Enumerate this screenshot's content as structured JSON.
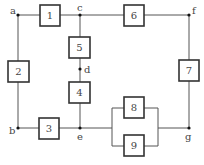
{
  "diagram": {
    "type": "reliability-block-diagram",
    "components": [
      {
        "id": "1",
        "label": "1"
      },
      {
        "id": "2",
        "label": "2"
      },
      {
        "id": "3",
        "label": "3"
      },
      {
        "id": "4",
        "label": "4"
      },
      {
        "id": "5",
        "label": "5"
      },
      {
        "id": "6",
        "label": "6"
      },
      {
        "id": "7",
        "label": "7"
      },
      {
        "id": "8",
        "label": "8"
      },
      {
        "id": "9",
        "label": "9"
      }
    ],
    "nodes": [
      {
        "id": "a",
        "label": "a"
      },
      {
        "id": "b",
        "label": "b"
      },
      {
        "id": "c",
        "label": "c"
      },
      {
        "id": "d",
        "label": "d"
      },
      {
        "id": "e",
        "label": "e"
      },
      {
        "id": "f",
        "label": "f"
      },
      {
        "id": "g",
        "label": "g"
      }
    ],
    "connections": [
      [
        "a",
        "1",
        "c"
      ],
      [
        "c",
        "6",
        "f"
      ],
      [
        "a",
        "2",
        "b"
      ],
      [
        "b",
        "3",
        "e"
      ],
      [
        "c",
        "5",
        "d"
      ],
      [
        "d",
        "4",
        "e"
      ],
      [
        "f",
        "7",
        "g"
      ],
      [
        "e",
        "8",
        "g"
      ],
      [
        "e",
        "9",
        "g"
      ]
    ],
    "colors": {
      "line": "#555555",
      "box_border": "#333333",
      "node": "#111111",
      "text": "#444444"
    }
  }
}
